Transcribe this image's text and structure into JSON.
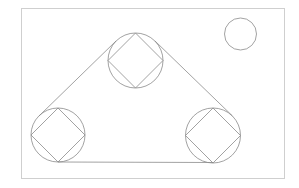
{
  "diagram": {
    "width": 299,
    "height": 188,
    "colors": {
      "background": "#ffffff",
      "frame": "#cfcfcf",
      "stroke": "#8a8a8a"
    },
    "frame": {
      "x": 21,
      "y": 8,
      "width": 263,
      "height": 170
    },
    "pulleys": [
      {
        "name": "top",
        "cx": 135.5,
        "cy": 60.5,
        "r": 27.5
      },
      {
        "name": "left",
        "cx": 58,
        "cy": 135,
        "r": 27
      },
      {
        "name": "right",
        "cx": 213,
        "cy": 135.5,
        "r": 27.5
      }
    ],
    "small_circle": {
      "cx": 240.5,
      "cy": 34,
      "r": 16
    },
    "belt": [
      {
        "name": "left-belt",
        "x1": 116,
        "y1": 41,
        "x2": 39,
        "y2": 116
      },
      {
        "name": "right-belt",
        "x1": 155,
        "y1": 41,
        "x2": 232.5,
        "y2": 116
      },
      {
        "name": "bottom-belt",
        "x1": 58,
        "y1": 162,
        "x2": 213,
        "y2": 162.5
      }
    ]
  }
}
